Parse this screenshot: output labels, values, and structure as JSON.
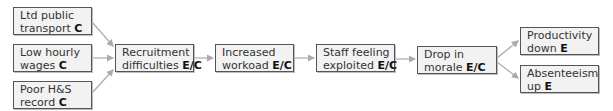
{
  "diagram": {
    "type": "cause-effect flow",
    "colors": {
      "box_fill": "#f2f2f2",
      "box_border": "#555555",
      "arrow": "#aaaaaa",
      "text": "#333333"
    },
    "nodes": [
      {
        "id": "transport",
        "line1": "Ltd public",
        "line2": "transport",
        "tag": "C"
      },
      {
        "id": "wages",
        "line1": "Low hourly",
        "line2": "wages",
        "tag": "C"
      },
      {
        "id": "hs",
        "line1": "Poor H&S",
        "line2": "record",
        "tag": "C"
      },
      {
        "id": "recruitment",
        "line1": "Recruitment",
        "line2": "difficulties",
        "tag": "E/C"
      },
      {
        "id": "workload",
        "line1": "Increased",
        "line2": "workoad",
        "tag": "E/C"
      },
      {
        "id": "exploited",
        "line1": "Staff feeling",
        "line2": "exploited",
        "tag": "E/C"
      },
      {
        "id": "morale",
        "line1": "Drop in",
        "line2": "morale",
        "tag": "E/C"
      },
      {
        "id": "productivity",
        "line1": "Productivity",
        "line2": "down",
        "tag": "E"
      },
      {
        "id": "absenteeism",
        "line1": "Absenteeism",
        "line2": "up",
        "tag": "E"
      }
    ],
    "edges": [
      [
        "transport",
        "recruitment"
      ],
      [
        "wages",
        "recruitment"
      ],
      [
        "hs",
        "recruitment"
      ],
      [
        "recruitment",
        "workload"
      ],
      [
        "workload",
        "exploited"
      ],
      [
        "exploited",
        "morale"
      ],
      [
        "morale",
        "productivity"
      ],
      [
        "morale",
        "absenteeism"
      ]
    ]
  }
}
